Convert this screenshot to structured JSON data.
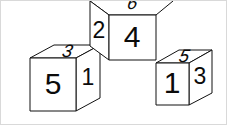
{
  "scene": {
    "title": "Three dice perspective view",
    "width": 227,
    "height": 125,
    "background_color": "#ffffff",
    "line_color": "#111111",
    "face_fill": "#ffffff",
    "digit_color": "#0b0b0b"
  },
  "dice": [
    {
      "id": "left-die",
      "name": "left-die",
      "faces": {
        "front": "5",
        "right": "1",
        "top": "3"
      },
      "geometry": {
        "front": "29,57 75,57 75,110 29,110",
        "right": "75,57 99,44 99,97 75,110",
        "top": "29,57 53,44 99,44 75,57"
      },
      "label_positions": {
        "front": {
          "x": 52,
          "y": 85
        },
        "right": {
          "x": 87,
          "y": 78
        },
        "top": {
          "x": 66,
          "y": 51
        }
      }
    },
    {
      "id": "middle-die",
      "name": "middle-die",
      "faces": {
        "front": "4",
        "left": "2",
        "top": "6"
      },
      "geometry": {
        "front": "108,14 155,14 155,59 108,59",
        "left": "89,0 108,14 108,59 89,45",
        "top": "89,0 132,-13 172,0 155,14 108,14"
      },
      "label_positions": {
        "front": {
          "x": 131,
          "y": 38
        },
        "left": {
          "x": 98,
          "y": 31
        },
        "top": {
          "x": 131,
          "y": 3
        }
      }
    },
    {
      "id": "right-die",
      "name": "right-die",
      "faces": {
        "front": "1",
        "right": "3",
        "top": "5"
      },
      "geometry": {
        "front": "155,62 188,62 188,104 155,104",
        "right": "188,62 211,49 211,92 188,104",
        "top": "155,62 178,49 211,49 188,62"
      },
      "label_positions": {
        "front": {
          "x": 171,
          "y": 84
        },
        "right": {
          "x": 199,
          "y": 77
        },
        "top": {
          "x": 183,
          "y": 56
        }
      }
    }
  ]
}
